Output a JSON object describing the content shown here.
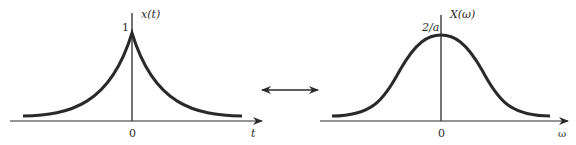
{
  "left_plot": {
    "function_label": "x(t)",
    "peak_label": "1",
    "origin_label": "0",
    "axis_label": "t",
    "shape": "two-sided decaying exponential, e^{-a|t|}"
  },
  "right_plot": {
    "function_label": "X(ω)",
    "peak_label": "2/a",
    "origin_label": "0",
    "axis_label": "ω",
    "shape": "bell-shaped Lorentzian, 2a/(a^2+ω^2)"
  },
  "relation": {
    "symbol": "double-headed arrow",
    "meaning": "Fourier transform pair"
  },
  "colors": {
    "ink": "#2a2a2a",
    "background": "#ffffff"
  }
}
